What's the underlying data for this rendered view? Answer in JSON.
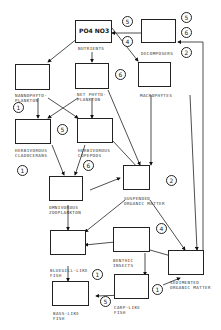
{
  "diagram": {
    "title": "",
    "nodes": {
      "nutrients": {
        "label": "NUTRIENTS",
        "content": "PO4 NO3"
      },
      "decomposers": {
        "label": "DECOMPOSERS"
      },
      "nannophytoplankton": {
        "label": "NANNOPHYTO-\nPLANKTON"
      },
      "net_phytoplankton": {
        "label": "NET PHYTO-\nPLANKTON"
      },
      "macrophytes": {
        "label": "MACROPHYTES"
      },
      "herbivorous_cladocerans": {
        "label": "HERBIVOROUS\nCLADOCERANS"
      },
      "herbivorous_copepods": {
        "label": "HERBIVOROUS\nCOPEPODS"
      },
      "omnivorous_zooplankton": {
        "label": "OMNIVOROUS\nZOOPLANKTON"
      },
      "suspended_organic_matter": {
        "label": "SUSPENDED\nORGANIC MATTER"
      },
      "bluegill_like_fish": {
        "label": "BLUEGILL-LIKE\nFISH"
      },
      "benthic_insects": {
        "label": "BENTHIC\nINSECTS"
      },
      "bass_like_fish": {
        "label": "BASS-LIKE\nFISH"
      },
      "carp_like_fish": {
        "label": "CARP-LIKE\nFISH"
      },
      "sedimented_organic_matter": {
        "label": "SEDIMENTED\nORGANIC MATTER"
      }
    },
    "markers": {
      "m5a": "5",
      "m5b": "5",
      "m6a": "6",
      "m4a": "4",
      "m2a": "2",
      "m6b": "6",
      "m1a": "1",
      "m5c": "5",
      "m1b": "1",
      "m6c": "6",
      "m2b": "2",
      "m4b": "4",
      "m1c": "1",
      "m5d": "5",
      "m1d": "1"
    }
  }
}
